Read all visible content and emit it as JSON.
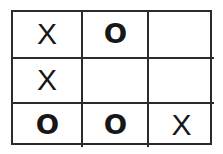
{
  "diagram": {
    "kind": "tic-tac-toe-board",
    "grid_size": 3,
    "colors": {
      "line": "#2b2b2b",
      "mark": "#171717",
      "background": "#ffffff"
    },
    "cells": [
      {
        "row": 0,
        "col": 0,
        "mark": "X",
        "label": "top-left"
      },
      {
        "row": 0,
        "col": 1,
        "mark": "O",
        "label": "top-center"
      },
      {
        "row": 0,
        "col": 2,
        "mark": "",
        "label": "top-right"
      },
      {
        "row": 1,
        "col": 0,
        "mark": "X",
        "label": "middle-left"
      },
      {
        "row": 1,
        "col": 1,
        "mark": "",
        "label": "middle-center"
      },
      {
        "row": 1,
        "col": 2,
        "mark": "",
        "label": "middle-right"
      },
      {
        "row": 2,
        "col": 0,
        "mark": "O",
        "label": "bottom-left"
      },
      {
        "row": 2,
        "col": 1,
        "mark": "O",
        "label": "bottom-center"
      },
      {
        "row": 2,
        "col": 2,
        "mark": "X",
        "label": "bottom-right"
      }
    ]
  }
}
